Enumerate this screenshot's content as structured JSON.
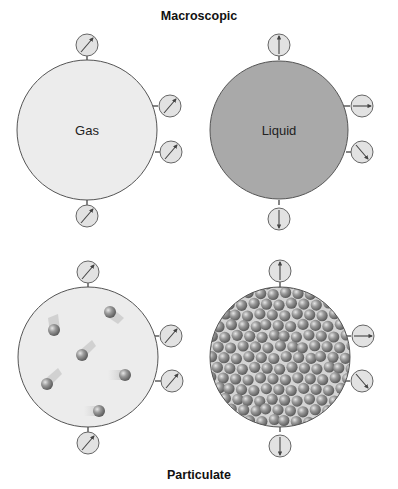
{
  "titles": {
    "top": "Macroscopic",
    "bottom": "Particulate"
  },
  "colors": {
    "gas_fill": "#ececec",
    "liquid_fill": "#a9a9a9",
    "outline": "#555555",
    "gauge_fill": "#e2e2e2",
    "particle": "#8c8c8c",
    "particle_highlight": "#d8d8d8"
  },
  "panels": [
    {
      "id": "gas-macroscopic",
      "label": "Gas",
      "state": "gas",
      "view": "macroscopic",
      "gauges": [
        {
          "position": "top",
          "arrow": "up-right"
        },
        {
          "position": "right-upper",
          "arrow": "up-right"
        },
        {
          "position": "right-lower",
          "arrow": "up-right"
        },
        {
          "position": "bottom",
          "arrow": "up-right"
        }
      ]
    },
    {
      "id": "liquid-macroscopic",
      "label": "Liquid",
      "state": "liquid",
      "view": "macroscopic",
      "gauges": [
        {
          "position": "top",
          "arrow": "up"
        },
        {
          "position": "right-upper",
          "arrow": "right"
        },
        {
          "position": "right-lower",
          "arrow": "down-right"
        },
        {
          "position": "bottom",
          "arrow": "down"
        }
      ]
    },
    {
      "id": "gas-particulate",
      "label": "",
      "state": "gas",
      "view": "particulate",
      "particle_count": 6,
      "gauges": [
        {
          "position": "top",
          "arrow": "up-right"
        },
        {
          "position": "right-upper",
          "arrow": "up-right"
        },
        {
          "position": "right-lower",
          "arrow": "up-right"
        },
        {
          "position": "bottom",
          "arrow": "up-right"
        }
      ]
    },
    {
      "id": "liquid-particulate",
      "label": "",
      "state": "liquid",
      "view": "particulate",
      "particle_count": "many (densely packed)",
      "gauges": [
        {
          "position": "top",
          "arrow": "up"
        },
        {
          "position": "right-upper",
          "arrow": "right"
        },
        {
          "position": "right-lower",
          "arrow": "down-right"
        },
        {
          "position": "bottom",
          "arrow": "down"
        }
      ]
    }
  ]
}
